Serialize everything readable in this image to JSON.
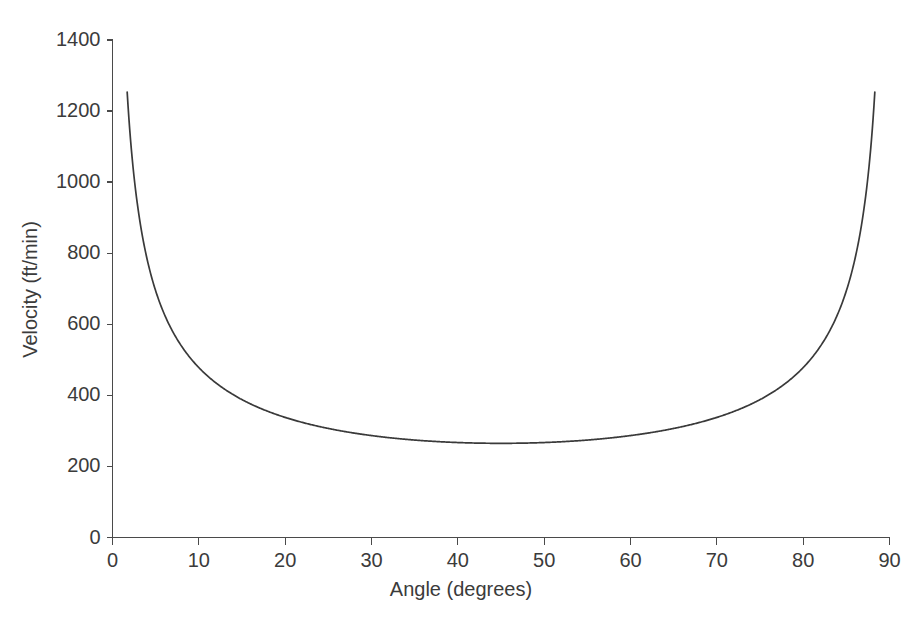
{
  "chart_data": {
    "type": "line",
    "title": "",
    "subtitle": "",
    "xlabel": "Angle (degrees)",
    "ylabel": "Velocity (ft/min)",
    "xlim": [
      0,
      90
    ],
    "ylim": [
      0,
      1400
    ],
    "xticks": [
      0,
      10,
      20,
      30,
      40,
      50,
      60,
      70,
      80,
      90
    ],
    "yticks": [
      0,
      200,
      400,
      600,
      800,
      1000,
      1200,
      1400
    ],
    "xtick_labels": [
      "0",
      "10",
      "20",
      "30",
      "40",
      "50",
      "60",
      "70",
      "80",
      "90"
    ],
    "ytick_labels": [
      "0",
      "200",
      "400",
      "600",
      "800",
      "1000",
      "1200",
      "1400"
    ],
    "grid": false,
    "legend": false,
    "legend_position": "none",
    "line_color": "#3a3a3a",
    "axis_color": "#4a4a4a",
    "background_color": "#ffffff",
    "series": [
      {
        "name": "Velocity vs Angle",
        "x": [
          1.7,
          2.0,
          2.5,
          3.0,
          3.5,
          4.0,
          4.5,
          5.0,
          6.0,
          7.0,
          8.0,
          9.0,
          10.0,
          12.0,
          14.0,
          16.0,
          18.0,
          20.0,
          22.0,
          24.0,
          26.0,
          28.0,
          30.0,
          33.0,
          36.0,
          39.0,
          42.0,
          45.0,
          48.0,
          51.0,
          54.0,
          57.0,
          60.0,
          62.0,
          64.0,
          66.0,
          68.0,
          70.0,
          72.0,
          74.0,
          76.0,
          78.0,
          80.0,
          81.0,
          82.0,
          83.0,
          84.0,
          85.0,
          85.5,
          86.0,
          86.5,
          87.0,
          87.5,
          88.0,
          88.3
        ],
        "y": [
          1355,
          1250,
          1125,
          1030,
          958,
          900,
          852,
          812,
          748,
          700,
          662,
          630,
          604,
          562,
          530,
          504,
          484,
          466,
          452,
          439,
          428,
          419,
          411,
          400,
          392,
          385,
          381,
          379,
          381,
          385,
          392,
          400,
          411,
          419,
          428,
          439,
          452,
          466,
          484,
          504,
          530,
          562,
          604,
          630,
          662,
          700,
          748,
          812,
          852,
          900,
          958,
          1030,
          1125,
          1250,
          1365
        ],
        "note": "U-shaped curve, symmetric about 45 degrees, minimum approximately 265 ft/min at 45 degrees, asymptotic near 0 and 90 degrees"
      }
    ],
    "minimum": {
      "x": 45,
      "y": 265
    },
    "endpoints": {
      "left": {
        "x": 1.7,
        "y": 1355
      },
      "right": {
        "x": 88.3,
        "y": 1365
      }
    }
  },
  "axes": {
    "x_title": "Angle (degrees)",
    "y_title": "Velocity (ft/min)"
  }
}
